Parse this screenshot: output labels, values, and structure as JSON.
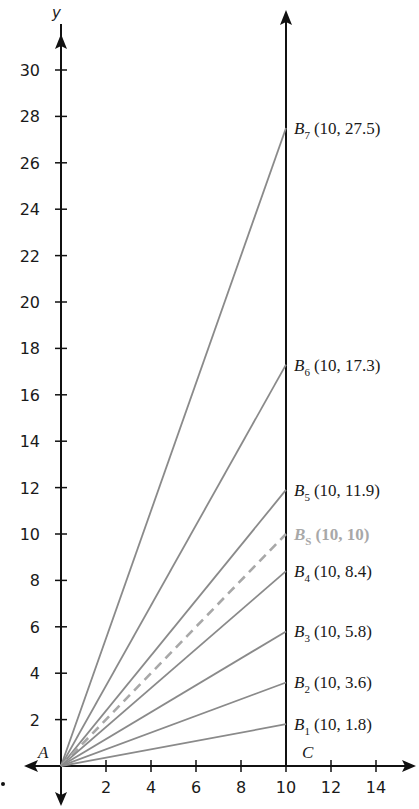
{
  "figure": {
    "axes": {
      "y_name": "y",
      "x_ticks": [
        "2",
        "4",
        "6",
        "8",
        "10",
        "12",
        "14"
      ],
      "y_ticks": [
        "2",
        "4",
        "6",
        "8",
        "10",
        "12",
        "14",
        "16",
        "18",
        "20",
        "22",
        "24",
        "26",
        "28",
        "30"
      ]
    },
    "points": {
      "A": "A",
      "C": "C"
    },
    "segments": [
      {
        "name": "B",
        "sub": "7",
        "coords": "(10, 27.5)",
        "y": 27.5
      },
      {
        "name": "B",
        "sub": "6",
        "coords": "(10, 17.3)",
        "y": 17.3
      },
      {
        "name": "B",
        "sub": "5",
        "coords": "(10, 11.9)",
        "y": 11.9
      },
      {
        "name": "B",
        "sub": "S",
        "coords": "(10, 10)",
        "y": 10,
        "style": "dashed-highlight"
      },
      {
        "name": "B",
        "sub": "4",
        "coords": "(10, 8.4)",
        "y": 8.4
      },
      {
        "name": "B",
        "sub": "3",
        "coords": "(10, 5.8)",
        "y": 5.8
      },
      {
        "name": "B",
        "sub": "2",
        "coords": "(10, 3.6)",
        "y": 3.6
      },
      {
        "name": "B",
        "sub": "1",
        "coords": "(10, 1.8)",
        "y": 1.8
      }
    ],
    "colors": {
      "axis": "#111111",
      "ray": "#8a8a8a",
      "highlight": "#a8a8a8"
    }
  },
  "chart_data": {
    "type": "line",
    "title": "",
    "xlabel": "",
    "ylabel": "y",
    "xlim": [
      0,
      15
    ],
    "ylim": [
      0,
      31
    ],
    "x_ticks": [
      2,
      4,
      6,
      8,
      10,
      12,
      14
    ],
    "y_ticks": [
      2,
      4,
      6,
      8,
      10,
      12,
      14,
      16,
      18,
      20,
      22,
      24,
      26,
      28,
      30
    ],
    "grid": false,
    "annotations": [
      "A",
      "C"
    ],
    "series": [
      {
        "name": "B7",
        "x": [
          0,
          10
        ],
        "y": [
          0,
          27.5
        ]
      },
      {
        "name": "B6",
        "x": [
          0,
          10
        ],
        "y": [
          0,
          17.3
        ]
      },
      {
        "name": "B5",
        "x": [
          0,
          10
        ],
        "y": [
          0,
          11.9
        ]
      },
      {
        "name": "BS",
        "x": [
          0,
          10
        ],
        "y": [
          0,
          10
        ],
        "style": "dashed"
      },
      {
        "name": "B4",
        "x": [
          0,
          10
        ],
        "y": [
          0,
          8.4
        ]
      },
      {
        "name": "B3",
        "x": [
          0,
          10
        ],
        "y": [
          0,
          5.8
        ]
      },
      {
        "name": "B2",
        "x": [
          0,
          10
        ],
        "y": [
          0,
          3.6
        ]
      },
      {
        "name": "B1",
        "x": [
          0,
          10
        ],
        "y": [
          0,
          1.8
        ]
      }
    ],
    "vertical_line": {
      "x": 10,
      "label": "C"
    }
  }
}
